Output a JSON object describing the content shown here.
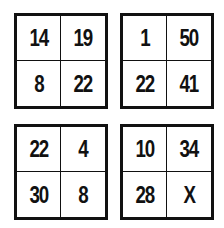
{
  "puzzle": {
    "boxes": [
      {
        "cells": [
          "14",
          "19",
          "8",
          "22"
        ]
      },
      {
        "cells": [
          "1",
          "50",
          "22",
          "41"
        ]
      },
      {
        "cells": [
          "22",
          "4",
          "30",
          "8"
        ]
      },
      {
        "cells": [
          "10",
          "34",
          "28",
          "X"
        ]
      }
    ],
    "unknown_symbol": "X"
  }
}
